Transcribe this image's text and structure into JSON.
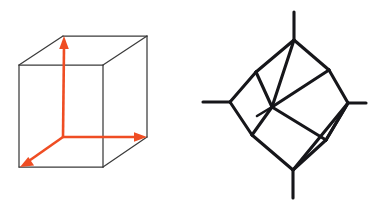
{
  "figure": {
    "background_color": "#ffffff",
    "width": 379,
    "height": 211,
    "panel_count": 2
  },
  "colors": {
    "cube_edge": "#3b3b3b",
    "axis": "#ef4d23",
    "graph_edge": "#16161a",
    "background": "#ffffff"
  },
  "left_panel": {
    "name": "cube-with-axes",
    "caption": "",
    "cube": {
      "type": "wireframe-cube",
      "front_face": {
        "top_left": [
          19,
          65
        ],
        "top_right": [
          103,
          65
        ],
        "bottom_right": [
          103,
          167
        ],
        "bottom_left": [
          19,
          167
        ]
      },
      "back_face": {
        "top_left": [
          63,
          36
        ],
        "top_right": [
          147,
          36
        ],
        "bottom_right": [
          147,
          137
        ],
        "bottom_left": [
          63,
          137
        ]
      },
      "visible_edges": 9,
      "hidden_edges": 0
    },
    "axes": {
      "origin": [
        63,
        137
      ],
      "arrow_count": 3,
      "arrows": [
        {
          "name": "z-axis-up",
          "from": [
            63,
            137
          ],
          "to": [
            64,
            36
          ],
          "direction": "up"
        },
        {
          "name": "x-axis-right",
          "from": [
            63,
            137
          ],
          "to": [
            147,
            137
          ],
          "direction": "right"
        },
        {
          "name": "y-axis-depth",
          "from": [
            63,
            137
          ],
          "to": [
            20,
            167
          ],
          "direction": "down-left"
        }
      ]
    }
  },
  "right_panel": {
    "name": "polyhedral-graph",
    "caption": "",
    "graph": {
      "type": "cube-graph-projection",
      "outer_vertex_count": 4,
      "stub_count": 5,
      "nodes": [
        {
          "id": "top",
          "pos": [
            294,
            40
          ]
        },
        {
          "id": "left",
          "pos": [
            230,
            102
          ]
        },
        {
          "id": "right",
          "pos": [
            348,
            103
          ]
        },
        {
          "id": "bottom",
          "pos": [
            293,
            170
          ]
        },
        {
          "id": "inner-top-left",
          "pos": [
            256,
            72
          ]
        },
        {
          "id": "inner-top-right",
          "pos": [
            329,
            70
          ]
        },
        {
          "id": "inner-center",
          "pos": [
            272,
            107
          ]
        },
        {
          "id": "inner-bottom-left",
          "pos": [
            252,
            135
          ]
        },
        {
          "id": "inner-bottom-right",
          "pos": [
            326,
            140
          ]
        }
      ],
      "stubs": [
        {
          "name": "stub-top",
          "from": [
            294,
            40
          ],
          "to": [
            294,
            12
          ]
        },
        {
          "name": "stub-left",
          "from": [
            230,
            102
          ],
          "to": [
            203,
            102
          ]
        },
        {
          "name": "stub-right",
          "from": [
            348,
            103
          ],
          "to": [
            366,
            103
          ]
        },
        {
          "name": "stub-bottom",
          "from": [
            293,
            170
          ],
          "to": [
            293,
            198
          ]
        },
        {
          "name": "stub-inner",
          "from": [
            272,
            107
          ],
          "to": [
            257,
            116
          ]
        }
      ]
    }
  }
}
